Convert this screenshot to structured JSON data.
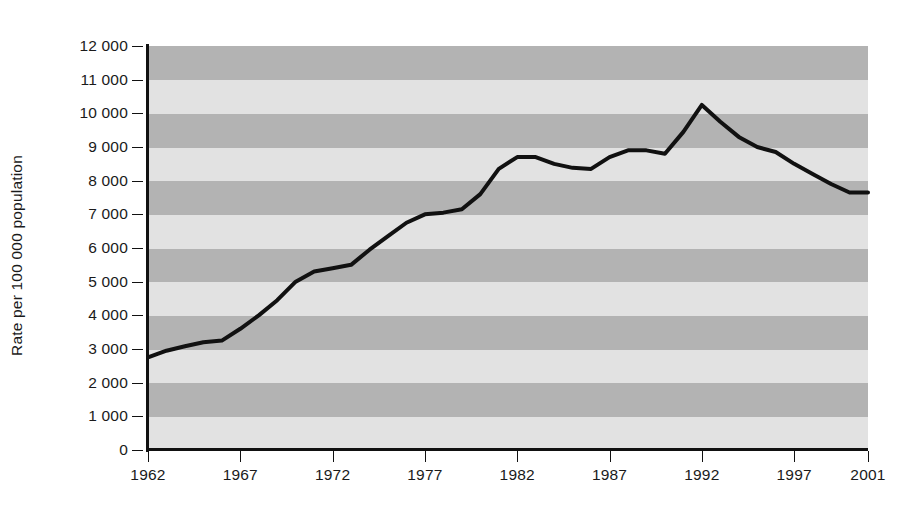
{
  "chart_data": {
    "type": "line",
    "title": "",
    "subtitle": "",
    "xlabel": "",
    "ylabel": "Rate per 100 000 population",
    "xlim": [
      1962,
      2001
    ],
    "ylim": [
      0,
      12000
    ],
    "yticks": [
      0,
      1000,
      2000,
      3000,
      4000,
      5000,
      6000,
      7000,
      8000,
      9000,
      10000,
      11000,
      12000
    ],
    "ytick_labels": [
      "0",
      "1 000",
      "2 000",
      "3 000",
      "4 000",
      "5 000",
      "6 000",
      "7 000",
      "8 000",
      "9 000",
      "10 000",
      "11 000",
      "12 000"
    ],
    "xticks": [
      1962,
      1967,
      1972,
      1977,
      1982,
      1987,
      1992,
      1997,
      2001
    ],
    "xtick_labels": [
      "1962",
      "1967",
      "1972",
      "1977",
      "1982",
      "1987",
      "1992",
      "1997",
      "2001"
    ],
    "grid": false,
    "banded_background": true,
    "band_interval": 1000,
    "legend": [],
    "annotations": [],
    "series": [
      {
        "name": "Rate per 100 000 population",
        "color": "#111111",
        "line_width": 4,
        "x": [
          1962,
          1963,
          1964,
          1965,
          1966,
          1967,
          1968,
          1969,
          1970,
          1971,
          1972,
          1973,
          1974,
          1975,
          1976,
          1977,
          1978,
          1979,
          1980,
          1981,
          1982,
          1983,
          1984,
          1985,
          1986,
          1987,
          1988,
          1989,
          1990,
          1991,
          1992,
          1993,
          1994,
          1995,
          1996,
          1997,
          1998,
          1999,
          2000,
          2001
        ],
        "values": [
          2750,
          2950,
          3080,
          3200,
          3250,
          3600,
          4000,
          4450,
          5000,
          5300,
          5400,
          5500,
          5950,
          6350,
          6750,
          7000,
          7050,
          7150,
          7600,
          8350,
          8700,
          8700,
          8500,
          8380,
          8350,
          8700,
          8900,
          8900,
          8800,
          9450,
          10250,
          9750,
          9300,
          9000,
          8850,
          8500,
          8200,
          7900,
          7650,
          7650
        ]
      }
    ]
  },
  "colors": {
    "band_dark": "#b3b3b3",
    "band_light": "#e2e2e2",
    "line": "#111111",
    "axis": "#111111",
    "text": "#1a1a1a"
  }
}
